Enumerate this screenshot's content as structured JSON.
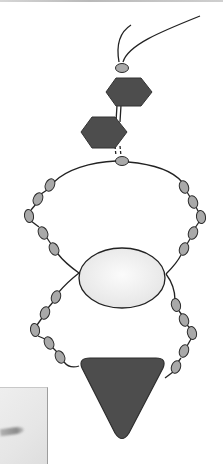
{
  "diagram": {
    "type": "molecular-schematic",
    "colors": {
      "bead_fill": "#a9a9a9",
      "hexagon_fill": "#4d4d4d",
      "ellipse_fill": "#efefef",
      "triangle_fill": "#4d4d4d",
      "line": "#222222"
    },
    "nodes": {
      "tail_strands": 2,
      "top_bead": {
        "shape": "oval",
        "cx": 122,
        "cy": 68
      },
      "hexagons": [
        {
          "name": "upper-hexagon",
          "cx": 128,
          "cy": 92
        },
        {
          "name": "lower-hexagon",
          "cx": 104,
          "cy": 132
        }
      ],
      "junction_bead": {
        "shape": "oval",
        "cx": 122,
        "cy": 161
      },
      "ellipse": {
        "cx": 122,
        "cy": 278,
        "rx": 43,
        "ry": 30
      },
      "triangle": {
        "points": [
          [
            80,
            358
          ],
          [
            165,
            358
          ],
          [
            122,
            440
          ]
        ]
      },
      "chains": [
        {
          "name": "upper-left",
          "beads": 5
        },
        {
          "name": "upper-right",
          "beads": 5
        },
        {
          "name": "lower-left",
          "beads": 5
        },
        {
          "name": "lower-right",
          "beads": 5
        }
      ]
    },
    "gel_inset": {
      "visible": true,
      "band_count": 1
    }
  }
}
